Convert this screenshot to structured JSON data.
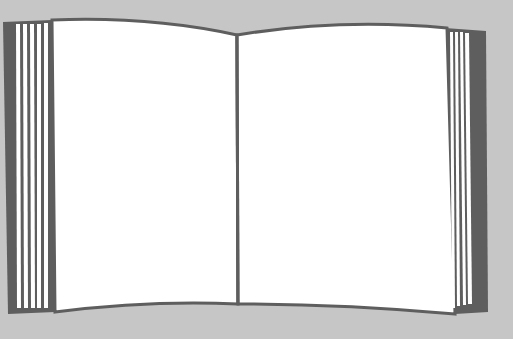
{
  "illustration": {
    "subject": "open book",
    "colors": {
      "background": "#c6c6c6",
      "ink": "#5e5e5e",
      "page": "#ffffff"
    },
    "left_page_edge_lines": 6,
    "right_page_edge_lines": 5
  }
}
